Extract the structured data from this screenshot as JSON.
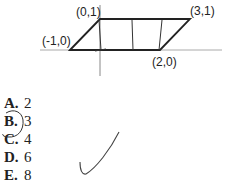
{
  "diagram": {
    "points": [
      {
        "label": "(0,1)"
      },
      {
        "label": "(3,1)"
      },
      {
        "label": "(-1,0)"
      },
      {
        "label": "(2,0)"
      }
    ]
  },
  "choices": [
    {
      "letter": "A.",
      "value": "2"
    },
    {
      "letter": "B.",
      "value": "3"
    },
    {
      "letter": "C.",
      "value": "4"
    },
    {
      "letter": "D.",
      "value": "6"
    },
    {
      "letter": "E.",
      "value": "8"
    }
  ],
  "annotations": {
    "circled_choice": "B",
    "checkmark": true
  }
}
